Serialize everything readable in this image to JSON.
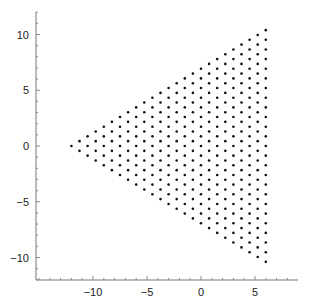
{
  "chart_data": {
    "type": "scatter",
    "title": "",
    "xlabel": "",
    "ylabel": "",
    "xlim": [
      -15.5,
      8.8
    ],
    "ylim": [
      -12,
      12
    ],
    "grid": false,
    "legend": null,
    "x_ticks": [
      -10,
      -5,
      0,
      5
    ],
    "y_ticks": [
      -10,
      -5,
      0,
      5,
      10
    ],
    "x_tick_labels": [
      "−10",
      "−5",
      "0",
      "5"
    ],
    "y_tick_labels": [
      "−10",
      "−5",
      "0",
      "5",
      "10"
    ],
    "series": [
      {
        "name": "triangular lattice points",
        "marker": "dot",
        "color": "#111111",
        "description": "Triangular (hexagonal) lattice filling an equilateral triangle with vertices (-12, 0), (6, 10.392), (6, -10.392); 25 points per side, 325 points total, lattice spacing ~0.866",
        "generator": {
          "vertices": [
            [
              -12,
              0
            ],
            [
              6,
              10.392
            ],
            [
              6,
              -10.392
            ]
          ],
          "points_per_side": 25
        }
      }
    ]
  },
  "axes": {
    "color": "#777777",
    "x_axis": {
      "label": "",
      "ticks": [
        "−10",
        "−5",
        "0",
        "5"
      ]
    },
    "y_axis": {
      "label": "",
      "ticks": [
        "10",
        "5",
        "0",
        "−5",
        "−10"
      ]
    }
  }
}
